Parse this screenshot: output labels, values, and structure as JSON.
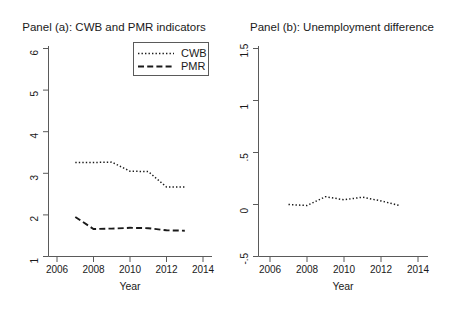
{
  "figure": {
    "background_color": "#ffffff",
    "line_color": "#1a1a1a",
    "axis_color": "#5a5a5a",
    "panel_count": 2
  },
  "panel_a": {
    "title": "Panel (a): CWB and PMR indicators",
    "xlabel": "Year",
    "ylabel": "",
    "x_ticks": [
      "2006",
      "2008",
      "2010",
      "2012",
      "2014"
    ],
    "y_ticks": [
      "1",
      "2",
      "3",
      "4",
      "5",
      "6"
    ],
    "legend": {
      "items": [
        {
          "label": "CWB",
          "style": "dotted"
        },
        {
          "label": "PMR",
          "style": "dashed"
        }
      ]
    }
  },
  "panel_b": {
    "title": "Panel (b): Unemployment difference",
    "xlabel": "Year",
    "ylabel": "",
    "x_ticks": [
      "2006",
      "2008",
      "2010",
      "2012",
      "2014"
    ],
    "y_ticks": [
      "-.5",
      "0",
      ".5",
      "1",
      "1.5"
    ]
  },
  "chart_data": [
    {
      "type": "line",
      "title": "Panel (a): CWB and PMR indicators",
      "xlabel": "Year",
      "ylabel": "",
      "xlim": [
        2006,
        2014
      ],
      "ylim": [
        1,
        6
      ],
      "xticks": [
        2006,
        2008,
        2010,
        2012,
        2014
      ],
      "yticks": [
        1,
        2,
        3,
        4,
        5,
        6
      ],
      "grid": false,
      "legend": "inside-top-right",
      "x": [
        2007,
        2008,
        2009,
        2010,
        2011,
        2012,
        2013
      ],
      "series": [
        {
          "name": "CWB",
          "style": "dotted",
          "values": [
            3.26,
            3.26,
            3.27,
            3.05,
            3.04,
            2.67,
            2.67
          ]
        },
        {
          "name": "PMR",
          "style": "dashed",
          "values": [
            1.95,
            1.66,
            1.67,
            1.69,
            1.68,
            1.63,
            1.62
          ]
        }
      ]
    },
    {
      "type": "line",
      "title": "Panel (b): Unemployment difference",
      "xlabel": "Year",
      "ylabel": "",
      "xlim": [
        2006,
        2014
      ],
      "ylim": [
        -0.5,
        1.5
      ],
      "xticks": [
        2006,
        2008,
        2010,
        2012,
        2014
      ],
      "yticks": [
        -0.5,
        0,
        0.5,
        1,
        1.5
      ],
      "grid": false,
      "legend": "none",
      "x": [
        2007,
        2008,
        2009,
        2010,
        2011,
        2012,
        2013
      ],
      "series": [
        {
          "name": "Unemployment difference",
          "style": "dotted",
          "values": [
            0.0,
            -0.01,
            0.075,
            0.045,
            0.07,
            0.035,
            -0.01
          ]
        }
      ]
    }
  ]
}
